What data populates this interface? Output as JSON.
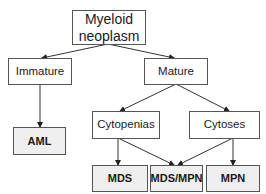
{
  "diagram": {
    "nodes": {
      "root": {
        "label_line1": "Myeloid",
        "label_line2": "neoplasm"
      },
      "immature": {
        "label": "Immature"
      },
      "mature": {
        "label": "Mature"
      },
      "aml": {
        "label": "AML"
      },
      "cytopenias": {
        "label": "Cytopenias"
      },
      "cytoses": {
        "label": "Cytoses"
      },
      "mds": {
        "label": "MDS"
      },
      "mds_mpn": {
        "label": "MDS/MPN"
      },
      "mpn": {
        "label": "MPN"
      }
    },
    "edges": [
      {
        "from": "root",
        "to": "immature"
      },
      {
        "from": "root",
        "to": "mature"
      },
      {
        "from": "immature",
        "to": "aml"
      },
      {
        "from": "mature",
        "to": "cytopenias"
      },
      {
        "from": "mature",
        "to": "cytoses"
      },
      {
        "from": "cytopenias",
        "to": "mds"
      },
      {
        "from": "cytopenias",
        "to": "mds_mpn"
      },
      {
        "from": "cytoses",
        "to": "mds_mpn"
      },
      {
        "from": "cytoses",
        "to": "mpn"
      }
    ],
    "colors": {
      "border": "#555555",
      "edge": "#333333",
      "leaf_fill": "#efefef",
      "node_fill": "#ffffff"
    }
  }
}
